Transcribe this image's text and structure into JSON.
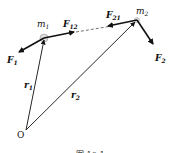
{
  "diagram": {
    "labels": {
      "m1": "m",
      "m1_sub": "1",
      "m2": "m",
      "m2_sub": "2",
      "F1": "F",
      "F1_sub": "1",
      "F2": "F",
      "F2_sub": "2",
      "F12": "F",
      "F12_sub": "12",
      "F21": "F",
      "F21_sub": "21",
      "r1": "r",
      "r1_sub": "1",
      "r2": "r",
      "r2_sub": "2",
      "origin": "O"
    },
    "caption": "图 10-1",
    "colors": {
      "line": "#111111",
      "particle": "#bbbbbb"
    }
  }
}
